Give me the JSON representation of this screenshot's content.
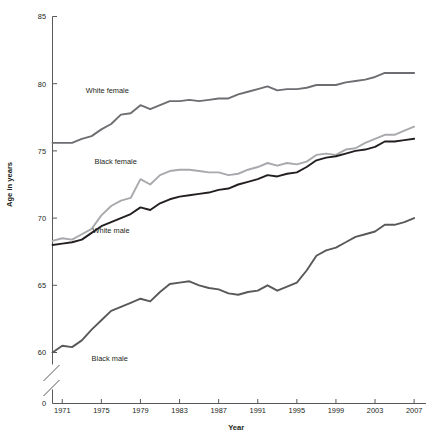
{
  "chart_data": {
    "type": "line",
    "title": "",
    "xlabel": "Year",
    "ylabel": "Age in years",
    "xlim": [
      1970,
      2007
    ],
    "ylim": [
      58.5,
      85
    ],
    "ytick_labels": [
      "85",
      "80",
      "75",
      "70",
      "65",
      "60",
      "0"
    ],
    "ytick_values": [
      85,
      80,
      75,
      70,
      65,
      60,
      0
    ],
    "xtick_labels": [
      "1971",
      "1975",
      "1979",
      "1983",
      "1987",
      "1991",
      "1995",
      "1999",
      "2003",
      "2007"
    ],
    "xtick_values": [
      1971,
      1975,
      1979,
      1983,
      1987,
      1991,
      1995,
      1999,
      2003,
      2007
    ],
    "grid": false,
    "legend_position": "inline-labels",
    "axis_break": true,
    "axis_break_note": "y-axis broken between 60 and 0",
    "x": [
      1970,
      1971,
      1972,
      1973,
      1974,
      1975,
      1976,
      1977,
      1978,
      1979,
      1980,
      1981,
      1982,
      1983,
      1984,
      1985,
      1986,
      1987,
      1988,
      1989,
      1990,
      1991,
      1992,
      1993,
      1994,
      1995,
      1996,
      1997,
      1998,
      1999,
      2000,
      2001,
      2002,
      2003,
      2004,
      2005,
      2006,
      2007
    ],
    "series": [
      {
        "name": "White female",
        "color": "#6d6e71",
        "label_x": 1973.4,
        "label_y": 79.3,
        "values": [
          75.6,
          75.6,
          75.6,
          75.9,
          76.1,
          76.6,
          77.0,
          77.7,
          77.8,
          78.4,
          78.1,
          78.4,
          78.7,
          78.7,
          78.8,
          78.7,
          78.8,
          78.9,
          78.9,
          79.2,
          79.4,
          79.6,
          79.8,
          79.5,
          79.6,
          79.6,
          79.7,
          79.9,
          79.9,
          79.9,
          80.1,
          80.2,
          80.3,
          80.5,
          80.8,
          80.8,
          80.8,
          80.8
        ]
      },
      {
        "name": "Black female",
        "color": "#a7a9ac",
        "label_x": 1974.3,
        "label_y": 74.0,
        "values": [
          68.3,
          68.5,
          68.4,
          68.8,
          69.2,
          70.2,
          70.9,
          71.3,
          71.5,
          72.9,
          72.5,
          73.2,
          73.5,
          73.6,
          73.6,
          73.5,
          73.4,
          73.4,
          73.2,
          73.3,
          73.6,
          73.8,
          74.1,
          73.9,
          74.1,
          74.0,
          74.2,
          74.7,
          74.8,
          74.7,
          75.1,
          75.2,
          75.6,
          75.9,
          76.2,
          76.2,
          76.5,
          76.8
        ]
      },
      {
        "name": "White male",
        "color": "#231f20",
        "label_x": 1974.1,
        "label_y": 68.9,
        "values": [
          68.0,
          68.1,
          68.2,
          68.4,
          68.9,
          69.4,
          69.7,
          70.0,
          70.3,
          70.8,
          70.6,
          71.1,
          71.4,
          71.6,
          71.7,
          71.8,
          71.9,
          72.1,
          72.2,
          72.5,
          72.7,
          72.9,
          73.2,
          73.1,
          73.3,
          73.4,
          73.8,
          74.3,
          74.5,
          74.6,
          74.8,
          75.0,
          75.1,
          75.3,
          75.7,
          75.7,
          75.8,
          75.9
        ]
      },
      {
        "name": "Black male",
        "color": "#58595b",
        "label_x": 1974.0,
        "label_y": 59.4,
        "values": [
          60.0,
          60.5,
          60.4,
          60.9,
          61.7,
          62.4,
          63.1,
          63.4,
          63.7,
          64.0,
          63.8,
          64.5,
          65.1,
          65.2,
          65.3,
          65.0,
          64.8,
          64.7,
          64.4,
          64.3,
          64.5,
          64.6,
          65.0,
          64.6,
          64.9,
          65.2,
          66.1,
          67.2,
          67.6,
          67.8,
          68.2,
          68.6,
          68.8,
          69.0,
          69.5,
          69.5,
          69.7,
          70.0
        ]
      }
    ]
  }
}
